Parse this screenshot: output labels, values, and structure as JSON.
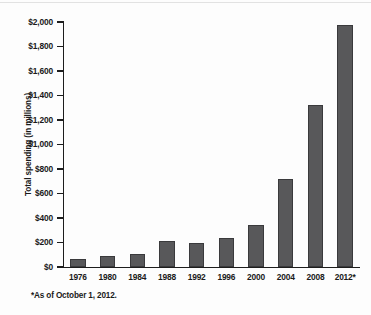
{
  "chart_data": {
    "type": "bar",
    "title": "",
    "subtitle": "",
    "xlabel": "",
    "ylabel": "Total spending (in millions)",
    "categories": [
      "1976",
      "1980",
      "1984",
      "1988",
      "1992",
      "1996",
      "2000",
      "2004",
      "2008",
      "2012*"
    ],
    "values": [
      65,
      93,
      104,
      211,
      192,
      240,
      345,
      717,
      1325,
      1975
    ],
    "ylim": [
      0,
      2000
    ],
    "y_ticks": [
      0,
      200,
      400,
      600,
      800,
      1000,
      1200,
      1400,
      1600,
      1800,
      2000
    ],
    "y_tick_labels": [
      "$0",
      "$200",
      "$400",
      "$600",
      "$800",
      "$1,000",
      "$1,200",
      "$1,400",
      "$1,600",
      "$1,800",
      "$2,000"
    ],
    "grid": false,
    "legend": false,
    "legend_position": "none",
    "bar_color": "#58585a",
    "bar_edge_color": "#3a3a3c",
    "axis_color": "#1d1d1d",
    "annotations": [
      "*As of October 1, 2012."
    ]
  },
  "footnote": "*As of October 1, 2012."
}
